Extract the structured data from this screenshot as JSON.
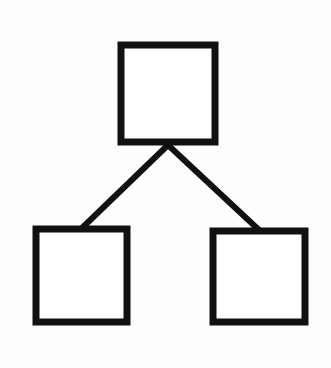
{
  "diagram": {
    "type": "hierarchy-tree",
    "background": "#fdfdfd",
    "stroke_color": "#111111",
    "fill_color": "#ffffff",
    "stroke_width": 7,
    "nodes": [
      {
        "id": "root",
        "label": "",
        "x": 121,
        "y": 45,
        "width": 94,
        "height": 97
      },
      {
        "id": "left",
        "label": "",
        "x": 36,
        "y": 229,
        "width": 91,
        "height": 93
      },
      {
        "id": "right",
        "label": "",
        "x": 213,
        "y": 231,
        "width": 92,
        "height": 91
      }
    ],
    "edges": [
      {
        "from": "root",
        "to": "left",
        "x1": 168,
        "y1": 145,
        "x2": 82,
        "y2": 228
      },
      {
        "from": "root",
        "to": "right",
        "x1": 168,
        "y1": 145,
        "x2": 259,
        "y2": 230
      }
    ]
  }
}
